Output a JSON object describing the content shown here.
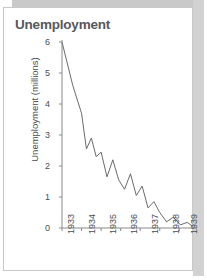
{
  "figure": {
    "title": "Unemployment",
    "card_border_color": "#c8c8c8",
    "shadow_color": "#c9c9c9",
    "background_color": "#ffffff"
  },
  "chart_data": {
    "type": "line",
    "title": "Unemployment",
    "xlabel": "",
    "ylabel": "Unemployment (millions)",
    "xlim": [
      1933,
      1939.7
    ],
    "ylim": [
      0,
      6
    ],
    "yticks": [
      0,
      1,
      2,
      3,
      4,
      5,
      6
    ],
    "xticks": [
      1933,
      1934,
      1935,
      1936,
      1937,
      1938,
      1939
    ],
    "xtick_labels": [
      "1933",
      "1934",
      "1935",
      "1936",
      "1937",
      "1938",
      "1939"
    ],
    "ytick_labels": [
      "0",
      "1",
      "2",
      "3",
      "4",
      "5",
      "6"
    ],
    "grid": false,
    "legend": false,
    "line_color": "#6b6b6b",
    "line_width": 1,
    "series": [
      {
        "name": "Unemployment (millions)",
        "x": [
          1933.0,
          1933.55,
          1934.0,
          1934.25,
          1934.5,
          1934.75,
          1935.0,
          1935.3,
          1935.6,
          1935.9,
          1936.2,
          1936.5,
          1936.8,
          1937.1,
          1937.4,
          1937.7,
          1938.0,
          1938.35,
          1938.7,
          1939.05,
          1939.4,
          1939.7
        ],
        "values": [
          6.0,
          4.6,
          3.7,
          2.55,
          2.9,
          2.3,
          2.45,
          1.65,
          2.2,
          1.55,
          1.25,
          1.75,
          1.05,
          1.35,
          0.65,
          0.85,
          0.5,
          0.2,
          0.35,
          0.1,
          0.18,
          0.05
        ]
      }
    ]
  },
  "axes": {
    "y_axis_name": "y-axis",
    "x_axis_name": "x-axis"
  }
}
